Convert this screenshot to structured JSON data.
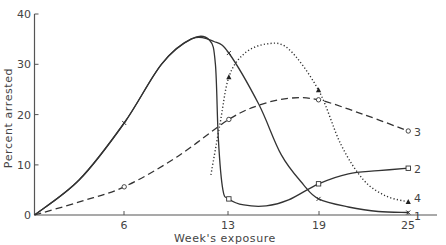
{
  "chart_data": {
    "type": "line",
    "title": "",
    "xlabel": "Week's exposure",
    "ylabel": "Percent arrested",
    "xlim": [
      0,
      27
    ],
    "ylim": [
      0,
      40
    ],
    "x_ticks": [
      6,
      13,
      19,
      25
    ],
    "y_ticks": [
      0,
      10,
      20,
      30,
      40
    ],
    "grid": false,
    "legend": "inline labels at right end of curves",
    "series": [
      {
        "name": "1",
        "style": "solid",
        "marker": "x",
        "points": [
          [
            0,
            0
          ],
          [
            6,
            18.3
          ],
          [
            13,
            32.2
          ],
          [
            19,
            3.2
          ],
          [
            25,
            0.5
          ]
        ],
        "curve": [
          [
            0,
            0
          ],
          [
            3,
            7
          ],
          [
            6,
            18.3
          ],
          [
            8.5,
            30
          ],
          [
            10.5,
            35
          ],
          [
            12,
            34.5
          ],
          [
            13,
            32.2
          ],
          [
            15,
            22
          ],
          [
            16.5,
            12
          ],
          [
            18,
            6
          ],
          [
            19,
            3.2
          ],
          [
            21,
            1.6
          ],
          [
            23,
            0.7
          ],
          [
            25,
            0.5
          ]
        ]
      },
      {
        "name": "2",
        "style": "solid",
        "marker": "square",
        "points": [
          [
            0,
            0
          ],
          [
            13,
            3.2
          ],
          [
            19,
            6.2
          ],
          [
            25,
            9.3
          ]
        ],
        "curve": [
          [
            0,
            0
          ],
          [
            3,
            7
          ],
          [
            6,
            18.3
          ],
          [
            8.5,
            30
          ],
          [
            10.5,
            35
          ],
          [
            11.7,
            34.8
          ],
          [
            12.1,
            30
          ],
          [
            12.3,
            15
          ],
          [
            12.6,
            5
          ],
          [
            13,
            3.2
          ],
          [
            14,
            2
          ],
          [
            15.5,
            1.8
          ],
          [
            17,
            3
          ],
          [
            19,
            6.2
          ],
          [
            21,
            8.2
          ],
          [
            23,
            8.8
          ],
          [
            25,
            9.3
          ]
        ]
      },
      {
        "name": "3",
        "style": "dashed",
        "marker": "circle",
        "points": [
          [
            0,
            0
          ],
          [
            6,
            5.6
          ],
          [
            13,
            19
          ],
          [
            19,
            22.9
          ],
          [
            25,
            16.7
          ]
        ],
        "curve": [
          [
            0,
            0
          ],
          [
            3,
            2.6
          ],
          [
            6,
            5.6
          ],
          [
            9.5,
            11.5
          ],
          [
            13,
            19
          ],
          [
            15,
            21.8
          ],
          [
            17,
            23.2
          ],
          [
            19,
            22.9
          ],
          [
            22,
            20
          ],
          [
            25,
            16.7
          ]
        ]
      },
      {
        "name": "4",
        "style": "dotted",
        "marker": "triangle",
        "points": [
          [
            13,
            27.4
          ],
          [
            19,
            24.8
          ],
          [
            25,
            2.6
          ]
        ],
        "curve": [
          [
            11.8,
            8
          ],
          [
            12.4,
            18
          ],
          [
            13,
            27.4
          ],
          [
            14,
            32
          ],
          [
            15.5,
            34
          ],
          [
            17,
            33
          ],
          [
            19,
            24.8
          ],
          [
            20.5,
            14
          ],
          [
            22,
            7
          ],
          [
            23.5,
            3.8
          ],
          [
            25,
            2.6
          ]
        ]
      }
    ]
  },
  "axes": {
    "y_tick_labels": [
      "0",
      "10",
      "20",
      "30",
      "40"
    ],
    "x_tick_labels": [
      "6",
      "13",
      "19",
      "25"
    ],
    "x_title": "Week's exposure",
    "y_title": "Percent arrested"
  },
  "series_labels": [
    "1",
    "2",
    "3",
    "4"
  ]
}
